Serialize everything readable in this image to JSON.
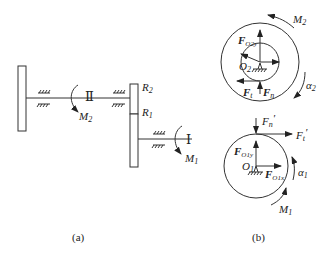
{
  "figure_a": {
    "caption": "(a)",
    "shaft_II_label": "Ⅱ",
    "shaft_I_label": "Ⅰ",
    "moment_M2": {
      "base": "M",
      "sub": "2"
    },
    "moment_M1": {
      "base": "M",
      "sub": "1"
    },
    "radius_R2": {
      "base": "R",
      "sub": "2"
    },
    "radius_R1": {
      "base": "R",
      "sub": "1"
    }
  },
  "figure_b": {
    "caption": "(b)",
    "gear2": {
      "moment": {
        "base": "M",
        "sub": "2"
      },
      "angular_acc": {
        "base": "α",
        "sub": "2"
      },
      "center": {
        "base": "O",
        "sub": "2"
      },
      "reaction_y": {
        "base": "F",
        "sub": "O2y"
      },
      "tangential": {
        "base": "F",
        "sub": "t"
      },
      "normal": {
        "base": "F",
        "sub": "n"
      }
    },
    "gear1": {
      "moment": {
        "base": "M",
        "sub": "1"
      },
      "angular_acc": {
        "base": "α",
        "sub": "1"
      },
      "center": {
        "base": "O",
        "sub": "1"
      },
      "reaction_y": {
        "base": "F",
        "sub": "O1y"
      },
      "reaction_x": {
        "base": "F",
        "sub": "O1x"
      },
      "tangential": {
        "base": "F",
        "sub": "t",
        "prime": "′"
      },
      "normal": {
        "base": "F",
        "sub": "n",
        "prime": "′"
      }
    }
  }
}
